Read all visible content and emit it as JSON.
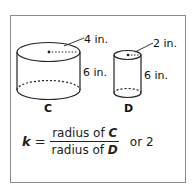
{
  "figure": {
    "cylinder_c": {
      "name": "C",
      "radius_label": "4 in.",
      "height_label": "6 in."
    },
    "cylinder_d": {
      "name": "D",
      "radius_label": "2 in.",
      "height_label": "6 in."
    }
  },
  "formula": {
    "variable": "k",
    "equals": "=",
    "numerator_text": "radius of ",
    "numerator_var": "C",
    "denominator_text": "radius of ",
    "denominator_var": "D",
    "result": "or 2"
  },
  "colors": {
    "stroke": "#222222",
    "border": "#8a8a8a",
    "background": "#ffffff"
  }
}
